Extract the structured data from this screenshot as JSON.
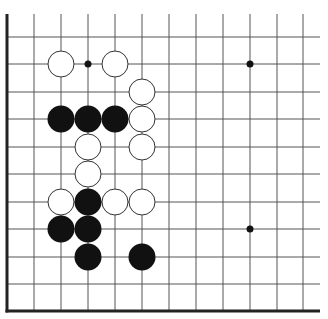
{
  "board": {
    "description": "Go board corner diagram (lower-left corner visible)",
    "colors": {
      "background": "#ffffff",
      "line": "#555555",
      "border": "#222222",
      "black_stone": "#111111",
      "white_stone": "#ffffff",
      "white_stone_edge": "#333333"
    },
    "grid": {
      "columns_x": [
        7,
        34,
        61,
        88,
        115,
        142,
        169,
        196,
        223,
        250,
        277,
        303
      ],
      "rows_y": [
        37,
        64,
        92,
        119,
        147,
        174,
        202,
        229,
        257,
        284,
        311
      ],
      "line_top": 14,
      "line_right": 320,
      "left_border_x": 7,
      "bottom_border_y": 311
    },
    "star_points": [
      {
        "col": 3,
        "row": 1
      },
      {
        "col": 9,
        "row": 1
      },
      {
        "col": 9,
        "row": 7
      }
    ],
    "stones": [
      {
        "color": "white",
        "col": 2,
        "row": 1
      },
      {
        "color": "white",
        "col": 4,
        "row": 1
      },
      {
        "color": "white",
        "col": 5,
        "row": 2
      },
      {
        "color": "black",
        "col": 2,
        "row": 3
      },
      {
        "color": "black",
        "col": 3,
        "row": 3
      },
      {
        "color": "black",
        "col": 4,
        "row": 3
      },
      {
        "color": "white",
        "col": 5,
        "row": 3
      },
      {
        "color": "white",
        "col": 3,
        "row": 4
      },
      {
        "color": "white",
        "col": 5,
        "row": 4
      },
      {
        "color": "white",
        "col": 3,
        "row": 5
      },
      {
        "color": "white",
        "col": 2,
        "row": 6
      },
      {
        "color": "black",
        "col": 3,
        "row": 6
      },
      {
        "color": "white",
        "col": 4,
        "row": 6
      },
      {
        "color": "white",
        "col": 5,
        "row": 6
      },
      {
        "color": "black",
        "col": 2,
        "row": 7
      },
      {
        "color": "black",
        "col": 3,
        "row": 7
      },
      {
        "color": "black",
        "col": 3,
        "row": 8
      },
      {
        "color": "black",
        "col": 5,
        "row": 8
      }
    ],
    "stone_radius": 13.5,
    "star_radius": 3.5
  }
}
